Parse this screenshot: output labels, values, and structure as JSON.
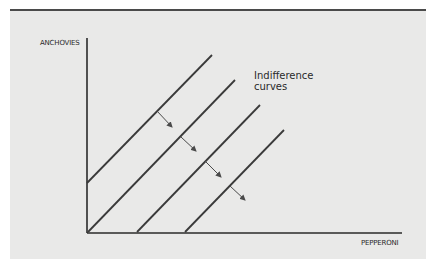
{
  "chart_data": {
    "type": "line",
    "title": "",
    "xlabel": "PEPPERONI",
    "ylabel": "ANCHOVIES",
    "annotation": [
      "Indifference",
      "curves"
    ],
    "grid": false,
    "legend": "none",
    "series": [
      {
        "name": "Indifference curve 1",
        "points": [
          [
            87,
            183
          ],
          [
            212,
            55
          ]
        ]
      },
      {
        "name": "Indifference curve 2",
        "points": [
          [
            88,
            232
          ],
          [
            235,
            80
          ]
        ]
      },
      {
        "name": "Indifference curve 3",
        "points": [
          [
            137,
            232
          ],
          [
            260,
            105
          ]
        ]
      },
      {
        "name": "Indifference curve 4",
        "points": [
          [
            185,
            232
          ],
          [
            284,
            130
          ]
        ]
      }
    ],
    "arrows": [
      {
        "from": [
          157,
          111
        ],
        "to": [
          172,
          127
        ]
      },
      {
        "from": [
          181,
          137
        ],
        "to": [
          196,
          151
        ]
      },
      {
        "from": [
          205,
          161
        ],
        "to": [
          221,
          177
        ]
      },
      {
        "from": [
          230,
          186
        ],
        "to": [
          245,
          200
        ]
      }
    ],
    "axes": {
      "origin": [
        87,
        233
      ],
      "x_end": 402,
      "y_top": 38
    }
  },
  "labels": {
    "y_axis": "ANCHOVIES",
    "x_axis": "PEPPERONI",
    "annotation_line1": "Indifference",
    "annotation_line2": "curves"
  },
  "colors": {
    "background": "#e9e9e8",
    "line": "#3a3a3a",
    "arrow": "#4a4a4a"
  }
}
